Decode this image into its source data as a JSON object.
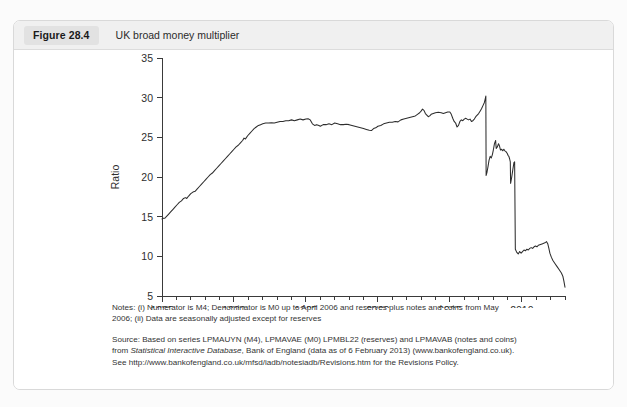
{
  "figure": {
    "badge": "Figure 28.4",
    "title": "UK broad money multiplier"
  },
  "notes": {
    "line1": "Notes: (i) Numerator is M4; Denominator is M0 up to April 2006 and reserves plus notes and coins from May",
    "line2": "2006; (ii) Data are seasonally adjusted except for reserves"
  },
  "source": {
    "line1_a": "Source: Based on series LPMAUYN (M4), LPMAVAE (M0) LPMBL22 (reserves) and LPMAVAB (notes and coins)",
    "line2_a": "from ",
    "line2_italic": "Statistical Interactive Database",
    "line2_b": ", Bank of England (data as of 6 February 2013) (www.bankofengland.co.uk).",
    "line3": "See http://www.bankofengland.co.uk/mfsd/iadb/notesiadb/Revisions.htm for the Revisions Policy."
  },
  "chart_data": {
    "type": "line",
    "title": "UK broad money multiplier",
    "xlabel": "",
    "ylabel": "Ratio",
    "xlim": [
      1985,
      2013
    ],
    "ylim": [
      5,
      35
    ],
    "yticks": [
      5,
      10,
      15,
      20,
      25,
      30,
      35
    ],
    "xticks": [
      1985,
      1990,
      1995,
      2000,
      2005,
      2010
    ],
    "x_minor_tick_step": 1,
    "grid": false,
    "legend": false,
    "line_color": "#2d2d2d",
    "series": [
      {
        "name": "UK broad money multiplier",
        "points": [
          [
            1985.0,
            14.7
          ],
          [
            1985.1,
            14.8
          ],
          [
            1985.2,
            14.8
          ],
          [
            1985.3,
            15.0
          ],
          [
            1985.45,
            15.3
          ],
          [
            1985.6,
            15.6
          ],
          [
            1985.75,
            15.9
          ],
          [
            1985.9,
            16.2
          ],
          [
            1986.05,
            16.5
          ],
          [
            1986.2,
            16.8
          ],
          [
            1986.35,
            17.0
          ],
          [
            1986.5,
            17.3
          ],
          [
            1986.62,
            17.4
          ],
          [
            1986.72,
            17.3
          ],
          [
            1986.85,
            17.6
          ],
          [
            1987.0,
            17.9
          ],
          [
            1987.15,
            18.1
          ],
          [
            1987.3,
            18.2
          ],
          [
            1987.45,
            18.5
          ],
          [
            1987.6,
            18.8
          ],
          [
            1987.75,
            19.1
          ],
          [
            1987.9,
            19.4
          ],
          [
            1988.05,
            19.7
          ],
          [
            1988.2,
            20.0
          ],
          [
            1988.35,
            20.3
          ],
          [
            1988.5,
            20.5
          ],
          [
            1988.65,
            20.8
          ],
          [
            1988.8,
            21.1
          ],
          [
            1988.95,
            21.4
          ],
          [
            1989.1,
            21.7
          ],
          [
            1989.25,
            22.0
          ],
          [
            1989.4,
            22.3
          ],
          [
            1989.55,
            22.6
          ],
          [
            1989.7,
            22.9
          ],
          [
            1989.85,
            23.2
          ],
          [
            1990.0,
            23.5
          ],
          [
            1990.15,
            23.8
          ],
          [
            1990.3,
            24.0
          ],
          [
            1990.45,
            24.3
          ],
          [
            1990.6,
            24.6
          ],
          [
            1990.7,
            24.9
          ],
          [
            1990.8,
            24.8
          ],
          [
            1990.95,
            25.2
          ],
          [
            1991.1,
            25.5
          ],
          [
            1991.25,
            25.8
          ],
          [
            1991.4,
            26.1
          ],
          [
            1991.55,
            26.3
          ],
          [
            1991.7,
            26.5
          ],
          [
            1991.85,
            26.6
          ],
          [
            1992.0,
            26.7
          ],
          [
            1992.2,
            26.8
          ],
          [
            1992.4,
            26.8
          ],
          [
            1992.6,
            26.85
          ],
          [
            1992.8,
            26.8
          ],
          [
            1993.0,
            26.9
          ],
          [
            1993.2,
            27.0
          ],
          [
            1993.4,
            27.0
          ],
          [
            1993.6,
            27.1
          ],
          [
            1993.8,
            27.1
          ],
          [
            1994.0,
            27.2
          ],
          [
            1994.2,
            27.1
          ],
          [
            1994.4,
            27.2
          ],
          [
            1994.6,
            27.3
          ],
          [
            1994.8,
            27.2
          ],
          [
            1995.0,
            27.3
          ],
          [
            1995.15,
            27.35
          ],
          [
            1995.3,
            27.2
          ],
          [
            1995.45,
            26.7
          ],
          [
            1995.6,
            26.5
          ],
          [
            1995.75,
            26.6
          ],
          [
            1995.9,
            26.5
          ],
          [
            1996.0,
            26.4
          ],
          [
            1996.2,
            26.6
          ],
          [
            1996.4,
            26.6
          ],
          [
            1996.6,
            26.7
          ],
          [
            1996.8,
            26.6
          ],
          [
            1997.0,
            26.8
          ],
          [
            1997.2,
            26.7
          ],
          [
            1997.4,
            26.6
          ],
          [
            1997.6,
            26.6
          ],
          [
            1997.8,
            26.65
          ],
          [
            1998.0,
            26.6
          ],
          [
            1998.2,
            26.5
          ],
          [
            1998.4,
            26.4
          ],
          [
            1998.6,
            26.3
          ],
          [
            1998.8,
            26.2
          ],
          [
            1999.0,
            26.1
          ],
          [
            1999.2,
            26.0
          ],
          [
            1999.4,
            25.9
          ],
          [
            1999.55,
            25.85
          ],
          [
            1999.7,
            26.1
          ],
          [
            1999.85,
            26.2
          ],
          [
            2000.0,
            26.4
          ],
          [
            2000.2,
            26.5
          ],
          [
            2000.4,
            26.7
          ],
          [
            2000.6,
            26.8
          ],
          [
            2000.8,
            26.9
          ],
          [
            2001.0,
            26.9
          ],
          [
            2001.2,
            27.0
          ],
          [
            2001.4,
            26.95
          ],
          [
            2001.6,
            27.2
          ],
          [
            2001.8,
            27.3
          ],
          [
            2002.0,
            27.4
          ],
          [
            2002.2,
            27.5
          ],
          [
            2002.4,
            27.6
          ],
          [
            2002.6,
            27.7
          ],
          [
            2002.75,
            27.9
          ],
          [
            2002.9,
            28.1
          ],
          [
            2003.0,
            28.3
          ],
          [
            2003.1,
            28.55
          ],
          [
            2003.2,
            28.4
          ],
          [
            2003.3,
            28.0
          ],
          [
            2003.4,
            27.8
          ],
          [
            2003.5,
            27.6
          ],
          [
            2003.6,
            27.7
          ],
          [
            2003.7,
            27.9
          ],
          [
            2003.85,
            28.0
          ],
          [
            2004.0,
            28.1
          ],
          [
            2004.2,
            28.15
          ],
          [
            2004.4,
            28.1
          ],
          [
            2004.55,
            28.0
          ],
          [
            2004.7,
            28.1
          ],
          [
            2004.85,
            28.2
          ],
          [
            2005.0,
            28.2
          ],
          [
            2005.1,
            27.9
          ],
          [
            2005.2,
            27.4
          ],
          [
            2005.3,
            27.0
          ],
          [
            2005.4,
            26.8
          ],
          [
            2005.5,
            26.3
          ],
          [
            2005.6,
            26.5
          ],
          [
            2005.7,
            27.0
          ],
          [
            2005.8,
            27.2
          ],
          [
            2005.9,
            27.1
          ],
          [
            2006.0,
            27.3
          ],
          [
            2006.1,
            27.4
          ],
          [
            2006.2,
            27.3
          ],
          [
            2006.3,
            27.2
          ],
          [
            2006.4,
            27.3
          ],
          [
            2006.5,
            27.0
          ],
          [
            2006.6,
            27.1
          ],
          [
            2006.7,
            27.3
          ],
          [
            2006.8,
            27.6
          ],
          [
            2006.9,
            27.8
          ],
          [
            2007.0,
            28.0
          ],
          [
            2007.1,
            28.3
          ],
          [
            2007.2,
            28.6
          ],
          [
            2007.3,
            29.0
          ],
          [
            2007.4,
            29.4
          ],
          [
            2007.45,
            29.8
          ],
          [
            2007.5,
            30.2
          ],
          [
            2007.52,
            20.2
          ],
          [
            2007.58,
            20.6
          ],
          [
            2007.65,
            21.3
          ],
          [
            2007.72,
            22.1
          ],
          [
            2007.8,
            22.6
          ],
          [
            2007.88,
            22.4
          ],
          [
            2007.95,
            22.8
          ],
          [
            2008.02,
            23.4
          ],
          [
            2008.1,
            24.2
          ],
          [
            2008.18,
            24.6
          ],
          [
            2008.22,
            23.6
          ],
          [
            2008.3,
            23.8
          ],
          [
            2008.38,
            24.2
          ],
          [
            2008.45,
            23.9
          ],
          [
            2008.52,
            23.4
          ],
          [
            2008.6,
            23.5
          ],
          [
            2008.68,
            23.3
          ],
          [
            2008.75,
            23.5
          ],
          [
            2008.82,
            23.3
          ],
          [
            2008.9,
            23.2
          ],
          [
            2008.98,
            23.0
          ],
          [
            2009.05,
            22.7
          ],
          [
            2009.1,
            22.6
          ],
          [
            2009.15,
            22.3
          ],
          [
            2009.2,
            21.9
          ],
          [
            2009.22,
            19.2
          ],
          [
            2009.3,
            20.0
          ],
          [
            2009.38,
            21.0
          ],
          [
            2009.45,
            21.8
          ],
          [
            2009.5,
            21.9
          ],
          [
            2009.55,
            10.9
          ],
          [
            2009.65,
            10.5
          ],
          [
            2009.75,
            10.3
          ],
          [
            2009.85,
            10.6
          ],
          [
            2009.95,
            10.4
          ],
          [
            2010.05,
            10.6
          ],
          [
            2010.15,
            10.8
          ],
          [
            2010.25,
            10.7
          ],
          [
            2010.35,
            10.9
          ],
          [
            2010.45,
            10.8
          ],
          [
            2010.55,
            11.0
          ],
          [
            2010.65,
            11.1
          ],
          [
            2010.75,
            11.0
          ],
          [
            2010.85,
            11.2
          ],
          [
            2010.95,
            11.3
          ],
          [
            2011.05,
            11.2
          ],
          [
            2011.15,
            11.4
          ],
          [
            2011.3,
            11.5
          ],
          [
            2011.45,
            11.6
          ],
          [
            2011.6,
            11.7
          ],
          [
            2011.72,
            11.85
          ],
          [
            2011.8,
            11.6
          ],
          [
            2011.88,
            11.0
          ],
          [
            2011.95,
            10.4
          ],
          [
            2012.05,
            9.9
          ],
          [
            2012.15,
            9.5
          ],
          [
            2012.3,
            9.1
          ],
          [
            2012.45,
            8.7
          ],
          [
            2012.6,
            8.3
          ],
          [
            2012.75,
            7.9
          ],
          [
            2012.85,
            7.5
          ],
          [
            2012.92,
            6.9
          ],
          [
            2012.97,
            6.4
          ],
          [
            2013.0,
            6.1
          ]
        ]
      }
    ]
  }
}
